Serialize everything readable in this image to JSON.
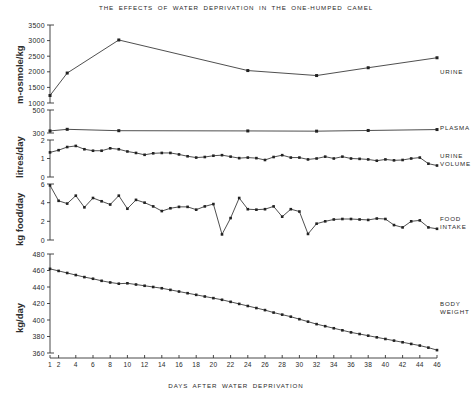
{
  "chart_data": {
    "type": "line",
    "title": "THE EFFECTS OF WATER DEPRIVATION IN THE ONE-HUMPED CAMEL",
    "xlabel": "DAYS AFTER WATER DEPRIVATION",
    "xlim": [
      1,
      46
    ],
    "xticks": [
      1,
      2,
      4,
      6,
      8,
      10,
      12,
      14,
      16,
      18,
      20,
      22,
      24,
      26,
      28,
      30,
      32,
      34,
      36,
      38,
      40,
      42,
      44,
      46
    ],
    "xticklabels": [
      "1",
      "2",
      "4",
      "6",
      "8",
      "10",
      "12",
      "14",
      "16",
      "18",
      "20",
      "22",
      "24",
      "26",
      "28",
      "30",
      "32",
      "34",
      "36",
      "38",
      "40",
      "42",
      "44",
      "46"
    ],
    "grid": false,
    "legend_position": "right-margin",
    "marker": "filled-square",
    "line_color": "#222222",
    "panels": [
      {
        "id": "urine-osmolality",
        "label": "URINE",
        "ylabel": "m-osmole/kg",
        "ylim": [
          1000,
          3500
        ],
        "yticks": [
          1000,
          1500,
          2000,
          2500,
          3000,
          3500
        ],
        "yticklabels": [
          "1000",
          "1500",
          "2000",
          "2500",
          "3000",
          "3500"
        ],
        "x": [
          1,
          3,
          9,
          24,
          32,
          38,
          46
        ],
        "values": [
          1240,
          1960,
          3020,
          2040,
          1880,
          2130,
          2450
        ]
      },
      {
        "id": "plasma-osmolality",
        "label": "PLASMA",
        "ylabel": "",
        "ylim": [
          300,
          500
        ],
        "yticks": [
          300,
          500
        ],
        "yticklabels": [
          "300",
          "500"
        ],
        "x": [
          1,
          3,
          9,
          24,
          32,
          38,
          46
        ],
        "values": [
          318,
          332,
          320,
          318,
          316,
          322,
          330
        ]
      },
      {
        "id": "urine-volume",
        "label": "URINE\nVOLUME",
        "ylabel": "litres/day",
        "ylim": [
          0,
          2
        ],
        "yticks": [
          0,
          1,
          2
        ],
        "yticklabels": [
          "0",
          "1",
          "2"
        ],
        "x": [
          1,
          2,
          3,
          4,
          5,
          6,
          7,
          8,
          9,
          10,
          11,
          12,
          13,
          14,
          15,
          16,
          17,
          18,
          19,
          20,
          21,
          22,
          23,
          24,
          25,
          26,
          27,
          28,
          29,
          30,
          31,
          32,
          33,
          34,
          35,
          36,
          37,
          38,
          39,
          40,
          41,
          42,
          43,
          44,
          45,
          46
        ],
        "values": [
          1.33,
          1.45,
          1.62,
          1.68,
          1.5,
          1.42,
          1.42,
          1.55,
          1.5,
          1.38,
          1.3,
          1.2,
          1.28,
          1.3,
          1.3,
          1.22,
          1.12,
          1.05,
          1.08,
          1.15,
          1.18,
          1.1,
          1.02,
          1.05,
          1.02,
          0.92,
          1.08,
          1.18,
          1.05,
          1.05,
          0.95,
          1.0,
          1.1,
          1.0,
          1.1,
          1.0,
          0.98,
          0.95,
          0.88,
          0.95,
          0.9,
          0.92,
          1.0,
          1.05,
          0.72,
          0.62
        ]
      },
      {
        "id": "food-intake",
        "label": "FOOD\nINTAKE",
        "ylabel": "kg food/day",
        "ylim": [
          0,
          6
        ],
        "yticks": [
          0,
          2,
          4,
          6
        ],
        "yticklabels": [
          "0",
          "2",
          "4",
          "6"
        ],
        "x": [
          1,
          2,
          3,
          4,
          5,
          6,
          7,
          8,
          9,
          10,
          11,
          12,
          13,
          14,
          15,
          16,
          17,
          18,
          19,
          20,
          21,
          22,
          23,
          24,
          25,
          26,
          27,
          28,
          29,
          30,
          31,
          32,
          33,
          34,
          35,
          36,
          37,
          38,
          39,
          40,
          41,
          42,
          43,
          44,
          45,
          46
        ],
        "values": [
          5.85,
          4.2,
          3.9,
          4.75,
          3.5,
          4.5,
          4.15,
          3.8,
          4.75,
          3.35,
          4.3,
          4.0,
          3.6,
          3.1,
          3.4,
          3.55,
          3.55,
          3.25,
          3.6,
          3.85,
          0.6,
          2.35,
          4.5,
          3.3,
          3.25,
          3.3,
          3.6,
          2.5,
          3.3,
          3.05,
          0.65,
          1.75,
          2.0,
          2.2,
          2.25,
          2.25,
          2.2,
          2.15,
          2.3,
          2.25,
          1.6,
          1.35,
          2.0,
          2.1,
          1.35,
          1.2
        ]
      },
      {
        "id": "body-weight",
        "label": "BODY\nWEIGHT",
        "ylabel": "kg/day",
        "ylim": [
          360,
          480
        ],
        "yticks": [
          360,
          380,
          400,
          420,
          440,
          460,
          480
        ],
        "yticklabels": [
          "360",
          "380",
          "400",
          "420",
          "440",
          "460",
          "480"
        ],
        "x": [
          1,
          2,
          3,
          4,
          5,
          6,
          7,
          8,
          9,
          10,
          11,
          12,
          13,
          14,
          15,
          16,
          17,
          18,
          19,
          20,
          21,
          22,
          23,
          24,
          25,
          26,
          27,
          28,
          29,
          30,
          31,
          32,
          33,
          34,
          35,
          36,
          37,
          38,
          39,
          40,
          41,
          42,
          43,
          44,
          45,
          46
        ],
        "values": [
          462,
          459.5,
          457,
          454.5,
          452,
          450,
          447.5,
          445.5,
          444,
          444.5,
          443,
          441.5,
          440,
          438.5,
          436.5,
          434.5,
          432.5,
          430.5,
          428.5,
          426.5,
          424.5,
          422,
          419.5,
          417,
          414.5,
          412,
          409,
          406.5,
          404,
          401,
          398,
          395,
          392.5,
          390,
          387.5,
          385,
          383,
          381,
          379,
          377,
          375,
          373,
          371,
          369,
          366.5,
          363.5
        ]
      }
    ]
  }
}
